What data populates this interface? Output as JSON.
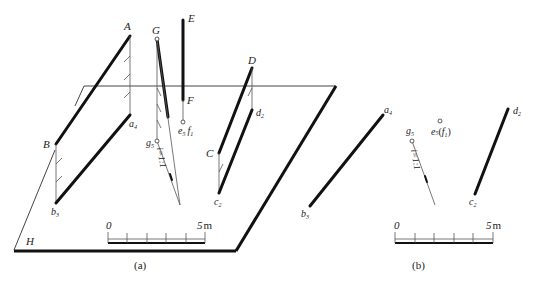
{
  "figure_a": {
    "caption": "(a)",
    "plane_label": "H",
    "points": {
      "A": "A",
      "B": "B",
      "C": "C",
      "D": "D",
      "E": "E",
      "F": "F",
      "G": "G",
      "a": "a",
      "a_sub": "4",
      "b": "b",
      "b_sub": "3",
      "c": "c",
      "c_sub": "2",
      "d": "d",
      "d_sub": "2",
      "e": "e",
      "e_sub": "5",
      "f": "f",
      "f_sub": "1",
      "g": "g",
      "g_sub": "5"
    },
    "slope_label": "i=1:1",
    "scale": {
      "start": "0",
      "end": "5",
      "unit": "m"
    }
  },
  "figure_b": {
    "caption": "(b)",
    "points": {
      "a": "a",
      "a_sub": "4",
      "b": "b",
      "b_sub": "3",
      "c": "c",
      "c_sub": "2",
      "d": "d",
      "d_sub": "2",
      "e": "e",
      "e_sub": "5",
      "f": "f",
      "f_sub": "1",
      "g": "g",
      "g_sub": "5"
    },
    "slope_label": "i=1:1",
    "scale": {
      "start": "0",
      "end": "5",
      "unit": "m"
    }
  }
}
